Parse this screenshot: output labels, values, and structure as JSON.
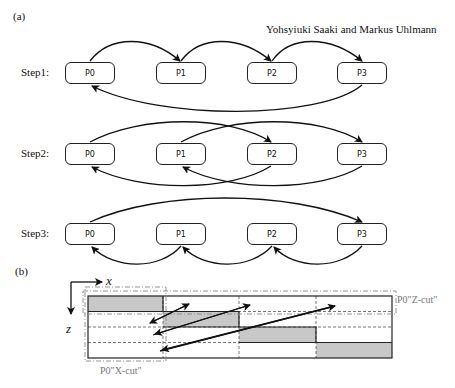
{
  "header": {
    "panel_a_label": "(a)",
    "panel_b_label": "(b)",
    "authors": "Yohsyiuki Saaki and Markus Uhlmann"
  },
  "panel_a": {
    "steps": [
      {
        "label": "Step1:",
        "processes": [
          "P0",
          "P1",
          "P2",
          "P3"
        ],
        "arrows": [
          [
            "P0",
            "P1"
          ],
          [
            "P1",
            "P2"
          ],
          [
            "P2",
            "P3"
          ],
          [
            "P3",
            "P0"
          ]
        ]
      },
      {
        "label": "Step2:",
        "processes": [
          "P0",
          "P1",
          "P2",
          "P3"
        ],
        "arrows": [
          [
            "P0",
            "P2"
          ],
          [
            "P1",
            "P3"
          ],
          [
            "P2",
            "P0"
          ],
          [
            "P3",
            "P1"
          ]
        ]
      },
      {
        "label": "Step3:",
        "processes": [
          "P0",
          "P1",
          "P2",
          "P3"
        ],
        "arrows": [
          [
            "P0",
            "P3"
          ],
          [
            "P1",
            "P0"
          ],
          [
            "P2",
            "P1"
          ],
          [
            "P3",
            "P2"
          ]
        ]
      }
    ]
  },
  "panel_b": {
    "x_axis_label": "x",
    "z_axis_label": "z",
    "z_cut_label": "P0\"Z-cut\"",
    "x_cut_label": "P0\"X-cut\"",
    "shade_color": "#c8c8c8",
    "grid_color": "#222222",
    "cut_color": "#888888"
  }
}
